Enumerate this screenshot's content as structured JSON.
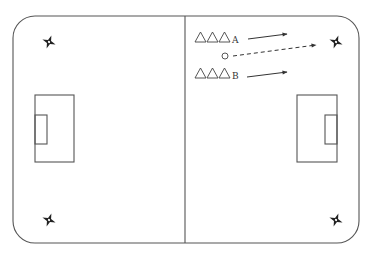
{
  "diagram": {
    "type": "soccer-drill",
    "pitch": {
      "x": 13,
      "y": 16,
      "width": 346,
      "height": 227,
      "corner_radius": 22,
      "line_color": "#555555",
      "center_line_x": 185
    },
    "penalty_boxes": [
      {
        "side": "left",
        "x": 35,
        "y": 95,
        "width": 39,
        "height": 67
      },
      {
        "side": "right",
        "x": 297,
        "y": 95,
        "width": 40,
        "height": 67
      }
    ],
    "goal_boxes": [
      {
        "side": "left",
        "x": 35,
        "y": 115,
        "width": 12,
        "height": 29
      },
      {
        "side": "right",
        "x": 325,
        "y": 115,
        "width": 12,
        "height": 29
      }
    ],
    "cones": [
      {
        "name": "cone-top-left",
        "x": 49,
        "y": 42
      },
      {
        "name": "cone-top-right",
        "x": 336,
        "y": 42
      },
      {
        "name": "cone-bottom-left",
        "x": 49,
        "y": 220
      },
      {
        "name": "cone-bottom-right",
        "x": 336,
        "y": 220
      }
    ],
    "groups": [
      {
        "label": "A",
        "players": 3,
        "x": 194,
        "y": 42,
        "arrow": {
          "x1": 248,
          "y1": 39,
          "x2": 287,
          "y2": 34
        }
      },
      {
        "label": "B",
        "players": 3,
        "x": 194,
        "y": 78,
        "arrow": {
          "x1": 247,
          "y1": 77,
          "x2": 287,
          "y2": 72
        }
      }
    ],
    "ball": {
      "x": 225,
      "y": 56,
      "r": 3,
      "pass_arrow": {
        "x1": 233,
        "y1": 56,
        "x2": 316,
        "y2": 45,
        "style": "dashed"
      }
    }
  },
  "labels": {
    "group_a": "A",
    "group_b": "B"
  }
}
